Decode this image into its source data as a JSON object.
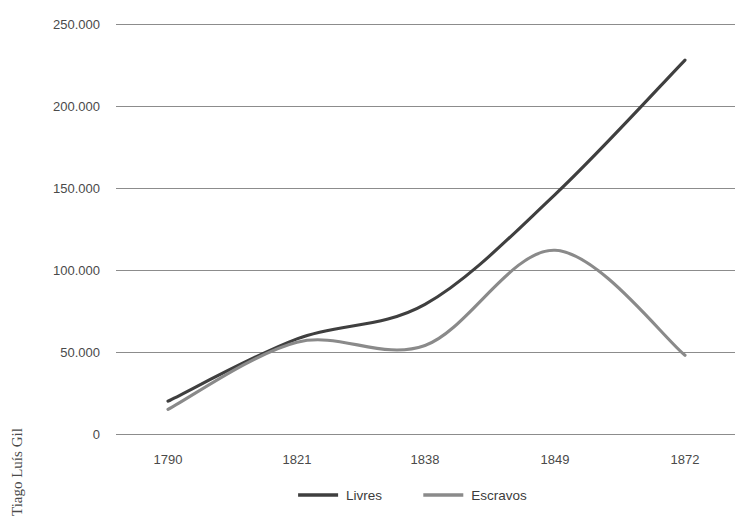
{
  "chart_data": {
    "type": "line",
    "title": "",
    "subtitle": "",
    "xlabel": "",
    "ylabel": "",
    "categories": [
      "1790",
      "1821",
      "1838",
      "1849",
      "1872"
    ],
    "x_tick_labels": [
      "1790",
      "1821",
      "1838",
      "1849",
      "1872"
    ],
    "y_tick_labels": [
      "250.000",
      "200.000",
      "150.000",
      "100.000",
      "50.000",
      "0"
    ],
    "y_tick_values": [
      250000,
      200000,
      150000,
      100000,
      50000,
      0
    ],
    "ylim": [
      0,
      250000
    ],
    "grid": "horizontal",
    "legend_position": "bottom-center",
    "series": [
      {
        "name": "Livres",
        "color": "#3f3f3f",
        "values": [
          20000,
          58000,
          79000,
          146000,
          228000
        ]
      },
      {
        "name": "Escravos",
        "color": "#8a8a8a",
        "values": [
          15000,
          56000,
          54000,
          112000,
          48000
        ]
      }
    ]
  },
  "legend": {
    "items": [
      {
        "label": "Livres",
        "color": "#3f3f3f"
      },
      {
        "label": "Escravos",
        "color": "#8a8a8a"
      }
    ]
  },
  "credit": {
    "text": "Tiago Luís Gil"
  },
  "colors": {
    "background": "#ffffff",
    "gridline": "#8c8c8c",
    "text": "#4a4a4a",
    "series_livres": "#3f3f3f",
    "series_escravos": "#8a8a8a"
  }
}
